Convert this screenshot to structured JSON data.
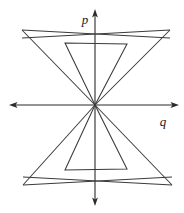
{
  "figure": {
    "background_color": "#ffffff",
    "line_color": "#3a3a3a",
    "axis_color": "#2b2b2b",
    "width": 184,
    "height": 213
  },
  "axes": {
    "origin": {
      "x": 95,
      "y": 105
    },
    "vertical": {
      "label": "p",
      "label_x": 85,
      "label_y": 20,
      "top_y": 10,
      "bottom_y": 205,
      "arrows": [
        "up",
        "down"
      ]
    },
    "horizontal": {
      "label": "q",
      "label_x": 163,
      "label_y": 124,
      "left_x": 10,
      "right_x": 178,
      "arrows": [
        "left",
        "right"
      ]
    }
  },
  "chart_data": {
    "type": "line",
    "xlabel": "q",
    "ylabel": "p",
    "grid": false,
    "legend": null,
    "origin_px": {
      "x": 95,
      "y": 105
    },
    "series": [
      {
        "name": "outer-upper-wedge",
        "closed": true,
        "points_px": [
          [
            95,
            105
          ],
          [
            22,
            30
          ],
          [
            170,
            30
          ],
          [
            95,
            105
          ]
        ],
        "note": "wide upper bowtie lobe with crossed arms meeting at origin"
      },
      {
        "name": "outer-lower-wedge",
        "closed": true,
        "points_px": [
          [
            95,
            105
          ],
          [
            23,
            185
          ],
          [
            172,
            185
          ],
          [
            95,
            105
          ]
        ],
        "note": "wide lower bowtie lobe mirrored about the q-axis"
      },
      {
        "name": "outer-upper-crossbar",
        "closed": false,
        "points_px": [
          [
            22,
            30
          ],
          [
            170,
            38
          ]
        ],
        "note": "upper long edge crossing the p-axis near p-axis y=38"
      },
      {
        "name": "outer-upper-crossbar-mirror",
        "closed": false,
        "points_px": [
          [
            170,
            30
          ],
          [
            22,
            38
          ]
        ],
        "note": "second upper long edge producing the narrow crossed sliver"
      },
      {
        "name": "outer-lower-crossbar",
        "closed": false,
        "points_px": [
          [
            23,
            185
          ],
          [
            172,
            177
          ]
        ],
        "note": "lower long edge crossing the p-axis near y=174"
      },
      {
        "name": "outer-lower-crossbar-mirror",
        "closed": false,
        "points_px": [
          [
            172,
            185
          ],
          [
            23,
            177
          ]
        ],
        "note": "second lower long edge producing the narrow crossed sliver"
      },
      {
        "name": "inner-upper-trapezoid",
        "closed": true,
        "points_px": [
          [
            95,
            105
          ],
          [
            65,
            43
          ],
          [
            127,
            44
          ],
          [
            95,
            105
          ]
        ],
        "note": "narrow upper inner cone with flat top edge"
      },
      {
        "name": "inner-lower-trapezoid",
        "closed": true,
        "points_px": [
          [
            95,
            105
          ],
          [
            65,
            170
          ],
          [
            127,
            169
          ],
          [
            95,
            105
          ]
        ],
        "note": "narrow lower inner cone with flat bottom edge"
      }
    ],
    "annotations": [
      {
        "text": "p",
        "x_px": 85,
        "y_px": 20,
        "style": "italic"
      },
      {
        "text": "q",
        "x_px": 163,
        "y_px": 124,
        "style": "italic"
      }
    ]
  }
}
